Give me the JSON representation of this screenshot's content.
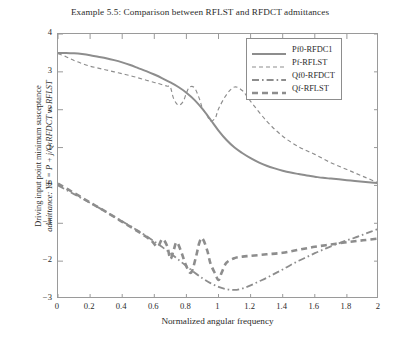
{
  "chart_data": {
    "type": "line",
    "title": "Example 5.5: Comparison between RFLST and RFDCT admittances",
    "xlabel": "Normalized angular frequency",
    "ylabel_line1": "Driving input point minimum susceptance",
    "ylabel_line2": "admittance: YF = P + j/Q:RFDCT vs RFLST",
    "xlim": [
      0,
      2
    ],
    "ylim": [
      -3,
      4
    ],
    "xticks": [
      "0",
      "0.2",
      "0.4",
      "0.6",
      "0.8",
      "1",
      "1.2",
      "1.4",
      "1.6",
      "1.8",
      "2"
    ],
    "yticks": [
      "4",
      "3",
      "2",
      "1",
      "0",
      "-1",
      "-2",
      "-3"
    ],
    "grid": false,
    "legend_position": "top-right",
    "line_color": "#8d8d8d",
    "series": [
      {
        "name": "Pf0-RFDCT",
        "style": "solid",
        "x": [
          0,
          0.05,
          0.1,
          0.15,
          0.2,
          0.25,
          0.3,
          0.35,
          0.4,
          0.45,
          0.5,
          0.55,
          0.6,
          0.65,
          0.7,
          0.75,
          0.8,
          0.85,
          0.9,
          0.95,
          1,
          1.05,
          1.1,
          1.15,
          1.2,
          1.25,
          1.3,
          1.35,
          1.4,
          1.45,
          1.5,
          1.55,
          1.6,
          1.65,
          1.7,
          1.75,
          1.8,
          1.85,
          1.9,
          1.95,
          2
        ],
        "y": [
          3.5,
          3.5,
          3.49,
          3.47,
          3.44,
          3.4,
          3.36,
          3.31,
          3.25,
          3.18,
          3.1,
          3.02,
          2.93,
          2.83,
          2.72,
          2.6,
          2.45,
          2.26,
          2.02,
          1.74,
          1.45,
          1.2,
          1.0,
          0.85,
          0.72,
          0.61,
          0.52,
          0.45,
          0.39,
          0.34,
          0.3,
          0.26,
          0.23,
          0.2,
          0.18,
          0.16,
          0.14,
          0.12,
          0.1,
          0.08,
          0.06
        ]
      },
      {
        "name": "Pf-RFLST",
        "style": "dashed-fine",
        "x": [
          0,
          0.05,
          0.1,
          0.15,
          0.2,
          0.25,
          0.3,
          0.35,
          0.4,
          0.45,
          0.5,
          0.55,
          0.6,
          0.62,
          0.65,
          0.68,
          0.7,
          0.72,
          0.75,
          0.78,
          0.8,
          0.82,
          0.85,
          0.88,
          0.9,
          0.93,
          0.95,
          0.98,
          1,
          1.05,
          1.1,
          1.15,
          1.2,
          1.3,
          1.4,
          1.5,
          1.6,
          1.7,
          1.8,
          1.9,
          2
        ],
        "y": [
          3.48,
          3.4,
          3.3,
          3.22,
          3.15,
          3.1,
          3.05,
          3.0,
          2.95,
          2.9,
          2.84,
          2.78,
          2.72,
          2.7,
          2.66,
          2.62,
          2.6,
          2.3,
          2.12,
          2.22,
          2.44,
          2.6,
          2.58,
          2.3,
          2.04,
          1.84,
          1.7,
          1.78,
          2.02,
          2.4,
          2.6,
          2.5,
          2.22,
          1.7,
          1.3,
          1.02,
          0.82,
          0.6,
          0.42,
          0.24,
          0.06
        ]
      },
      {
        "name": "Qf0-RFDCT",
        "style": "dash-dot",
        "x": [
          0,
          0.1,
          0.2,
          0.3,
          0.4,
          0.5,
          0.6,
          0.65,
          0.7,
          0.75,
          0.8,
          0.85,
          0.9,
          0.95,
          1,
          1.05,
          1.1,
          1.15,
          1.2,
          1.25,
          1.3,
          1.35,
          1.4,
          1.45,
          1.5,
          1.55,
          1.6,
          1.65,
          1.7,
          1.75,
          1.8,
          1.85,
          1.9,
          1.95,
          2
        ],
        "y": [
          0,
          -0.23,
          -0.46,
          -0.7,
          -0.95,
          -1.2,
          -1.48,
          -1.63,
          -1.79,
          -1.96,
          -2.13,
          -2.3,
          -2.45,
          -2.58,
          -2.68,
          -2.74,
          -2.76,
          -2.72,
          -2.64,
          -2.54,
          -2.44,
          -2.33,
          -2.22,
          -2.1,
          -1.99,
          -1.89,
          -1.79,
          -1.7,
          -1.61,
          -1.53,
          -1.45,
          -1.38,
          -1.3,
          -1.22,
          -1.14
        ]
      },
      {
        "name": "Qf-RFLST",
        "style": "dashed-bold",
        "x": [
          0,
          0.1,
          0.2,
          0.3,
          0.4,
          0.5,
          0.58,
          0.62,
          0.65,
          0.68,
          0.7,
          0.72,
          0.74,
          0.77,
          0.8,
          0.83,
          0.86,
          0.88,
          0.9,
          0.93,
          0.95,
          0.98,
          1,
          1.02,
          1.05,
          1.1,
          1.15,
          1.2,
          1.3,
          1.4,
          1.5,
          1.6,
          1.7,
          1.8,
          1.9,
          2
        ],
        "y": [
          0.05,
          -0.2,
          -0.45,
          -0.7,
          -0.96,
          -1.22,
          -1.45,
          -1.62,
          -1.42,
          -1.6,
          -1.94,
          -1.72,
          -1.5,
          -1.78,
          -2.14,
          -2.3,
          -1.88,
          -1.52,
          -1.4,
          -1.72,
          -2.06,
          -2.34,
          -2.5,
          -2.3,
          -2.04,
          -1.92,
          -1.88,
          -1.86,
          -1.82,
          -1.78,
          -1.7,
          -1.62,
          -1.56,
          -1.5,
          -1.45,
          -1.4
        ]
      }
    ]
  },
  "legend": {
    "items": [
      {
        "label": "Pf0-RFDC1",
        "style": "solid"
      },
      {
        "label": "Pf-RFLST",
        "style": "dashed-fine"
      },
      {
        "label": "Qf0-RFDCT",
        "style": "dash-dot"
      },
      {
        "label": "Qf-RFLST",
        "style": "dashed-bold"
      }
    ]
  }
}
